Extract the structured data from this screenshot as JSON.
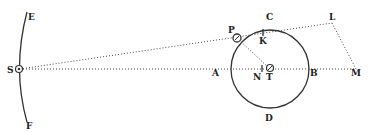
{
  "diagram": {
    "labels": {
      "E": "E",
      "F": "F",
      "S": "S",
      "P": "P",
      "C": "C",
      "K": "K",
      "L": "L",
      "A": "A",
      "N": "N",
      "T": "T",
      "B": "B",
      "M": "M",
      "D": "D"
    },
    "colors": {
      "ink": "#333333",
      "background": "#ffffff"
    }
  }
}
